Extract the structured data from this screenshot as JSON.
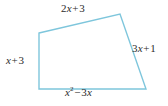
{
  "figure": {
    "type": "quadrilateral-with-side-labels",
    "stroke_color": "#7EC6DC",
    "text_color": "#2b2b2b",
    "background_color": "#ffffff",
    "vertices": {
      "top_left": {
        "x": 39,
        "y": 33
      },
      "top_right": {
        "x": 120,
        "y": 14
      },
      "bottom_right": {
        "x": 146,
        "y": 89
      },
      "bottom_left": {
        "x": 39,
        "y": 89
      }
    },
    "labels": {
      "top": {
        "text": "2x + 3",
        "coefficient": "2",
        "variable": "x",
        "operator": "+",
        "constant": "3"
      },
      "right": {
        "text": "3x + 1",
        "coefficient": "3",
        "variable": "x",
        "operator": "+",
        "constant": "1"
      },
      "left": {
        "text": "x + 3",
        "variable": "x",
        "operator": "+",
        "constant": "3"
      },
      "bottom": {
        "text": "x² − 3x",
        "variable": "x",
        "exponent": "2",
        "operator": "−",
        "coefficient": "3",
        "variable2": "x"
      }
    }
  }
}
